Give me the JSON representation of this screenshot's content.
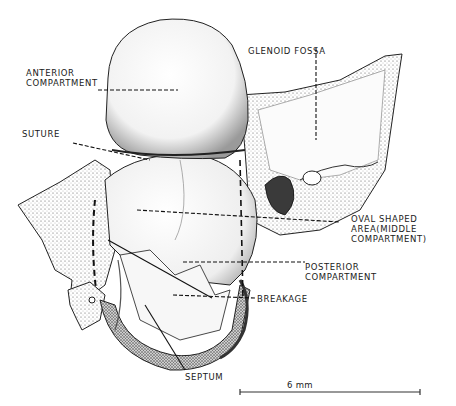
{
  "figure": {
    "colors": {
      "ink": "#1a1a1a",
      "background": "#ffffff",
      "shade": "#6a6a6a"
    }
  },
  "labels": {
    "anterior": {
      "line1": "ANTERIOR",
      "line2": "COMPARTMENT"
    },
    "glenoid": "GLENOID  FOSSA",
    "suture": "SUTURE",
    "oval": {
      "line1": "OVAL SHAPED",
      "line2": "AREA(MIDDLE",
      "line3": "COMPARTMENT)"
    },
    "posterior": {
      "line1": "POSTERIOR",
      "line2": "COMPARTMENT"
    },
    "breakage": "BREAKAGE",
    "septum": "SEPTUM"
  },
  "scale_bar": {
    "label": "6 mm"
  }
}
